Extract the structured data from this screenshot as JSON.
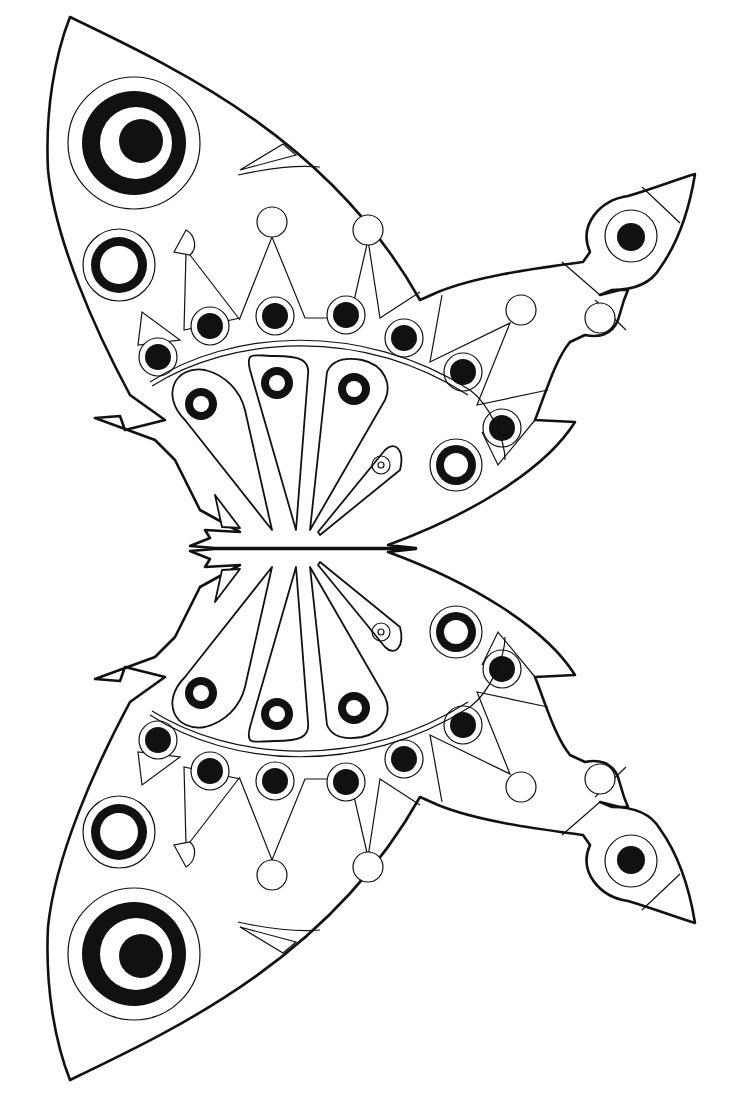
{
  "page": {
    "kind": "coloring-page",
    "orientation": "wings left, body horizontal, antennae right",
    "colors": {
      "line": "#111111",
      "background": "#ffffff"
    }
  },
  "wings": [
    {
      "id": "upper-wing",
      "eyespots_large": 2,
      "dotted_row_count": 7,
      "petal_count": 4
    },
    {
      "id": "lower-wing",
      "eyespots_large": 2,
      "dotted_row_count": 7,
      "petal_count": 4
    }
  ],
  "antennae": [
    {
      "id": "upper-antenna-tip",
      "icon": "eyespot"
    },
    {
      "id": "lower-antenna-tip",
      "icon": "eyespot"
    }
  ]
}
